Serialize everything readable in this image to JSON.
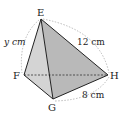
{
  "figure": {
    "type": "triangular pyramid (tetrahedron) diagram",
    "vertices": {
      "E": {
        "label": "E",
        "x": 41,
        "y": 19
      },
      "F": {
        "label": "F",
        "x": 24,
        "y": 75
      },
      "G": {
        "label": "G",
        "x": 53,
        "y": 99
      },
      "H": {
        "label": "H",
        "x": 108,
        "y": 75
      }
    },
    "measurements": {
      "EF": "y cm",
      "EH": "12 cm",
      "GH": "8 cm"
    },
    "hidden_edge": "FH",
    "colors": {
      "face_light": "#d6d6d6",
      "face_dark": "#b8b8b8",
      "edge": "#222222",
      "dimension_arc": "#aaaaaa"
    }
  }
}
